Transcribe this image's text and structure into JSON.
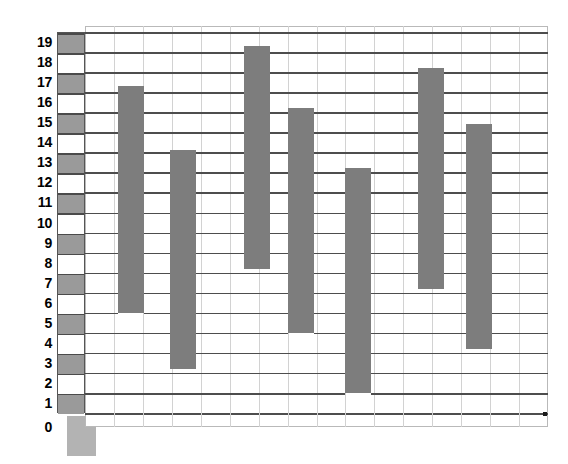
{
  "chart_data": {
    "type": "bar",
    "subtype": "floating-range-bar",
    "title": "",
    "subtitle": "",
    "xlabel": "",
    "ylabel": "",
    "grid": true,
    "legend": false,
    "legend_position": "none",
    "ylim": [
      0,
      19
    ],
    "y_ticks": [
      0,
      1,
      2,
      3,
      4,
      5,
      6,
      7,
      8,
      9,
      10,
      11,
      12,
      13,
      14,
      15,
      16,
      17,
      18,
      19
    ],
    "y_tick_labels": [
      "0",
      "1",
      "2",
      "3",
      "4",
      "5",
      "6",
      "7",
      "8",
      "9",
      "10",
      "11",
      "12",
      "13",
      "14",
      "15",
      "16",
      "17",
      "18",
      "19"
    ],
    "x_ticks": [],
    "x_tick_labels": [],
    "categories": [
      "1",
      "2",
      "3",
      "4",
      "5",
      "6",
      "7"
    ],
    "series": [
      {
        "name": "range",
        "low": [
          5.5,
          2.7,
          7.7,
          4.5,
          1.5,
          6.7,
          3.7
        ],
        "high": [
          16.8,
          13.6,
          18.8,
          15.7,
          12.7,
          17.7,
          14.9
        ]
      }
    ],
    "values": [
      11.3,
      10.9,
      11.1,
      11.2,
      11.2,
      11.0,
      11.2
    ],
    "bar_color": "#7d7d7d",
    "grid_color": "#4d4d4d",
    "vertical_grid_color": "#d2d2d2",
    "background_color": "#ffffff",
    "axis_color": "#4d4d4d",
    "annotations": []
  },
  "legend_stripe": {
    "label": "",
    "swatch_on_color": "#9a9a9a",
    "swatch_off_color": "#ffffff",
    "rows_filled": [
      19,
      17,
      15,
      13,
      11,
      9,
      7,
      5,
      3,
      1
    ],
    "rows_empty": [
      18,
      16,
      14,
      12,
      10,
      8,
      6,
      4,
      2
    ]
  },
  "zero_marker": {
    "label": "0",
    "color": "#b3b3b3"
  }
}
